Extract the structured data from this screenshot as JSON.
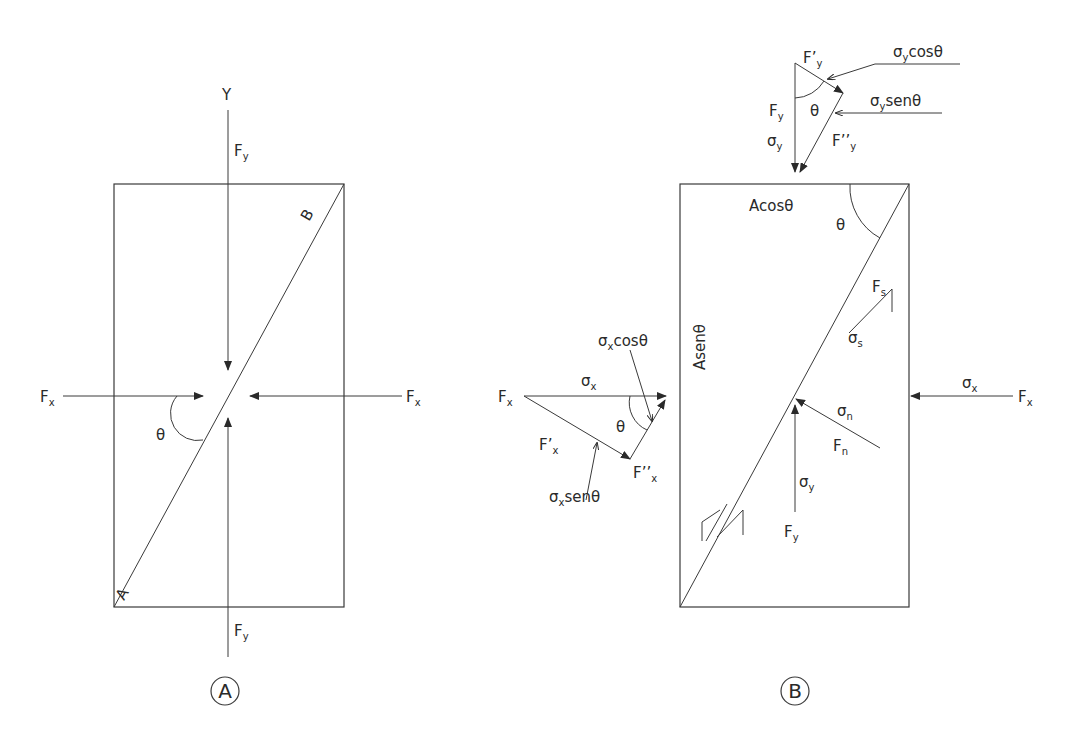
{
  "figure": {
    "panel_a": {
      "caption": "A",
      "axis_label": "Y",
      "corner_top": "B",
      "corner_bottom": "A",
      "force_y_top": {
        "main": "F",
        "sub": "y"
      },
      "force_y_bottom": {
        "main": "F",
        "sub": "y"
      },
      "force_x_left": {
        "main": "F",
        "sub": "x"
      },
      "force_x_right": {
        "main": "F",
        "sub": "x"
      },
      "angle": "θ"
    },
    "panel_b": {
      "caption": "B",
      "top_face": "Acosθ",
      "left_face": "Asenθ",
      "angle_top": "θ",
      "y_triangle": {
        "f_prime": {
          "main": "F’",
          "sub": "y"
        },
        "f": {
          "main": "F",
          "sub": "y"
        },
        "sigma": {
          "main": "σ",
          "sub": "y"
        },
        "f_dprime": {
          "main": "F’’",
          "sub": "y"
        },
        "angle": "θ",
        "cos_label": {
          "main": "σ",
          "sub": "y",
          "rest": "cosθ"
        },
        "sen_label": {
          "main": "σ",
          "sub": "y",
          "rest": "senθ"
        }
      },
      "x_triangle": {
        "f": {
          "main": "F",
          "sub": "x"
        },
        "sigma": {
          "main": "σ",
          "sub": "x"
        },
        "f_prime": {
          "main": "F’",
          "sub": "x"
        },
        "f_dprime": {
          "main": "F’’",
          "sub": "x"
        },
        "angle": "θ",
        "cos_label": {
          "main": "σ",
          "sub": "x",
          "rest": "cosθ"
        },
        "sen_label": {
          "main": "σ",
          "sub": "x",
          "rest": "senθ"
        }
      },
      "shear_force": {
        "main": "F",
        "sub": "s"
      },
      "shear_stress": {
        "main": "σ",
        "sub": "s"
      },
      "normal_stress": {
        "main": "σ",
        "sub": "n"
      },
      "normal_force": {
        "main": "F",
        "sub": "n"
      },
      "inner_sigma_y": {
        "main": "σ",
        "sub": "y"
      },
      "inner_f_y": {
        "main": "F",
        "sub": "y"
      },
      "right_sigma_x": {
        "main": "σ",
        "sub": "x"
      },
      "right_f_x": {
        "main": "F",
        "sub": "x"
      }
    }
  }
}
